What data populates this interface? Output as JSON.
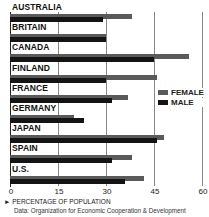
{
  "chart_data": {
    "type": "bar",
    "orientation": "horizontal",
    "title": "",
    "categories": [
      "AUSTRALIA",
      "BRITAIN",
      "CANADA",
      "FINLAND",
      "FRANCE",
      "GERMANY",
      "JAPAN",
      "SPAIN",
      "U.S."
    ],
    "series": [
      {
        "name": "FEMALE",
        "color": "#5a5a5a",
        "values": [
          38,
          30,
          56,
          46,
          37,
          20,
          48,
          38,
          42
        ]
      },
      {
        "name": "MALE",
        "color": "#141414",
        "values": [
          29,
          30,
          45,
          30,
          32,
          23,
          46,
          32,
          36
        ]
      }
    ],
    "xlabel": "PERCENTAGE OF POPULATION",
    "ylabel": "",
    "xlim": [
      0,
      60
    ],
    "xticks": [
      0,
      15,
      30,
      45,
      60
    ],
    "grid": true,
    "legend_position": "right-middle",
    "source": "Data: Organization for Economic Cooperation & Development"
  },
  "axis": {
    "ticks": [
      "0",
      "15",
      "30",
      "45",
      "60"
    ],
    "xlabel": "► PERCENTAGE OF POPULATION"
  },
  "legend": {
    "female": "FEMALE",
    "male": "MALE"
  },
  "source": "Data: Organization for Economic Cooperation & Development"
}
